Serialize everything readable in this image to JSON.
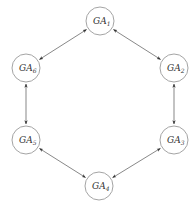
{
  "diagram": {
    "title": "",
    "nodes": [
      {
        "id": "GA1",
        "prefix": "GA",
        "sub": "1",
        "x": 100,
        "y": 21
      },
      {
        "id": "GA2",
        "prefix": "GA",
        "sub": "2",
        "x": 174,
        "y": 68
      },
      {
        "id": "GA3",
        "prefix": "GA",
        "sub": "3",
        "x": 174,
        "y": 140
      },
      {
        "id": "GA4",
        "prefix": "GA",
        "sub": "4",
        "x": 99,
        "y": 186
      },
      {
        "id": "GA5",
        "prefix": "GA",
        "sub": "5",
        "x": 26,
        "y": 140
      },
      {
        "id": "GA6",
        "prefix": "GA",
        "sub": "6",
        "x": 26,
        "y": 68
      }
    ],
    "edges": [
      {
        "from": "GA1",
        "to": "GA2",
        "type": "bidirectional"
      },
      {
        "from": "GA2",
        "to": "GA3",
        "type": "bidirectional"
      },
      {
        "from": "GA3",
        "to": "GA4",
        "type": "bidirectional"
      },
      {
        "from": "GA4",
        "to": "GA5",
        "type": "bidirectional"
      },
      {
        "from": "GA5",
        "to": "GA6",
        "type": "bidirectional"
      },
      {
        "from": "GA6",
        "to": "GA1",
        "type": "bidirectional"
      }
    ],
    "node_radius": 14,
    "colors": {
      "node_stroke": "#9a9a9a",
      "edge": "#555555",
      "text": "#333333"
    }
  }
}
